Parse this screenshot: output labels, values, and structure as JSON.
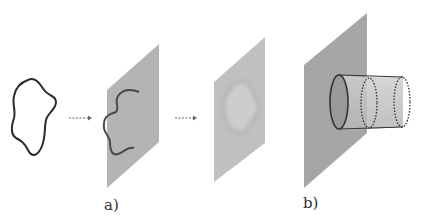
{
  "figure": {
    "labels": {
      "a": "a)",
      "b": "b)"
    },
    "colors": {
      "curve": "#2b2b2b",
      "plane_dark": "#a8a8a8",
      "plane_light": "#c2c2c2",
      "arrow": "#666666"
    },
    "elements": [
      "closed-loop-curve",
      "dashed-arrow-1",
      "plane-with-open-curve",
      "dashed-arrow-2",
      "plane-with-blurred-loop",
      "plane-with-cylinder-tube"
    ]
  }
}
